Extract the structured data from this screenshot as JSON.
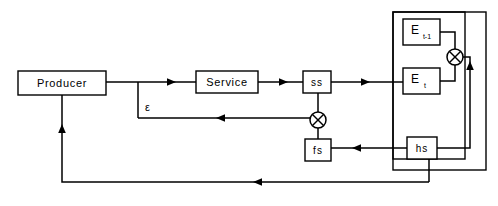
{
  "diagram": {
    "background_color": "#ffffff",
    "line_color": "#000000",
    "nodes": {
      "producer": {
        "label": "Producer",
        "x": 18,
        "y": 71,
        "w": 88,
        "h": 24
      },
      "service": {
        "label": "Service",
        "x": 196,
        "y": 71,
        "w": 62,
        "h": 22
      },
      "ss": {
        "label": "ss",
        "x": 303,
        "y": 71,
        "w": 28,
        "h": 22
      },
      "fs": {
        "label": "fs",
        "x": 305,
        "y": 139,
        "w": 26,
        "h": 22
      },
      "hs": {
        "label": "hs",
        "x": 407,
        "y": 137,
        "w": 30,
        "h": 22
      },
      "e_prev": {
        "label": "E",
        "subscript": "t-1",
        "x": 403,
        "y": 19,
        "w": 37,
        "h": 26
      },
      "e_curr": {
        "label": "E",
        "subscript": "t",
        "x": 403,
        "y": 68,
        "w": 37,
        "h": 26
      }
    },
    "operators": {
      "mult_upper": {
        "symbol": "circled-times",
        "cx": 455,
        "cy": 57,
        "r": 8
      },
      "mult_lower": {
        "symbol": "circled-times",
        "cx": 318,
        "cy": 120,
        "r": 8
      }
    },
    "containers": {
      "outer_block": {
        "x": 393,
        "y": 12,
        "w": 93,
        "h": 158
      },
      "inner_block": {
        "x": 393,
        "y": 12,
        "w": 72,
        "h": 147
      }
    },
    "edge_labels": {
      "epsilon": "ε"
    },
    "edges": [
      {
        "name": "producer-to-service",
        "from": "producer",
        "to": "service",
        "arrow": true
      },
      {
        "name": "service-to-ss",
        "from": "service",
        "to": "ss",
        "arrow": true
      },
      {
        "name": "ss-to-e-curr",
        "from": "ss",
        "to": "e_curr",
        "arrow": true
      },
      {
        "name": "e-prev-to-mult-upper",
        "from": "e_prev",
        "to": "mult_upper",
        "arrow": false
      },
      {
        "name": "e-curr-to-mult-upper",
        "from": "e_curr",
        "to": "mult_upper",
        "arrow": false
      },
      {
        "name": "mult-upper-to-hs",
        "from": "mult_upper",
        "to": "hs",
        "arrow": true
      },
      {
        "name": "hs-to-fs",
        "from": "hs",
        "to": "fs",
        "arrow": true
      },
      {
        "name": "fs-to-mult-lower",
        "from": "fs",
        "to": "mult_lower",
        "arrow": false
      },
      {
        "name": "ss-to-mult-lower",
        "from": "ss",
        "to": "mult_lower",
        "arrow": false
      },
      {
        "name": "mult-lower-to-epsilon-branch",
        "from": "mult_lower",
        "to": "epsilon",
        "arrow": true
      },
      {
        "name": "outer-feedback-to-producer",
        "from": "outer_block",
        "to": "producer",
        "arrow": true
      }
    ]
  }
}
